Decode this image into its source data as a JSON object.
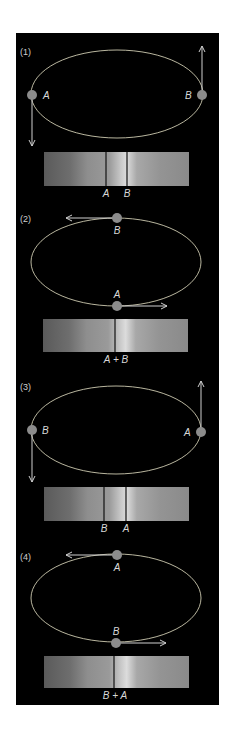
{
  "figure": {
    "colors": {
      "background": "#000000",
      "page": "#ffffff",
      "orbit": "#e8e4c8",
      "star": "#8c8c8c",
      "arrow": "#d0d0d0",
      "line": "#111111",
      "text": "#d8d8d8"
    },
    "panels": [
      {
        "label": "(1)",
        "star_left_label": "A",
        "star_right_label": "B",
        "spectrum_labels": [
          "A",
          "B"
        ],
        "description": "A at left moving down (toward observer, blueshift), B at right moving up (redshift); lines split"
      },
      {
        "label": "(2)",
        "star_top_label": "B",
        "star_bottom_label": "A",
        "spectrum_label": "A + B",
        "description": "Stars moving perpendicular to line of sight; lines merged"
      },
      {
        "label": "(3)",
        "star_left_label": "B",
        "star_right_label": "A",
        "spectrum_labels": [
          "B",
          "A"
        ],
        "description": "B at left moving down, A at right moving up; lines split reversed"
      },
      {
        "label": "(4)",
        "star_top_label": "A",
        "star_bottom_label": "B",
        "spectrum_label": "B + A",
        "description": "Stars moving perpendicular to line of sight; lines merged"
      }
    ]
  }
}
